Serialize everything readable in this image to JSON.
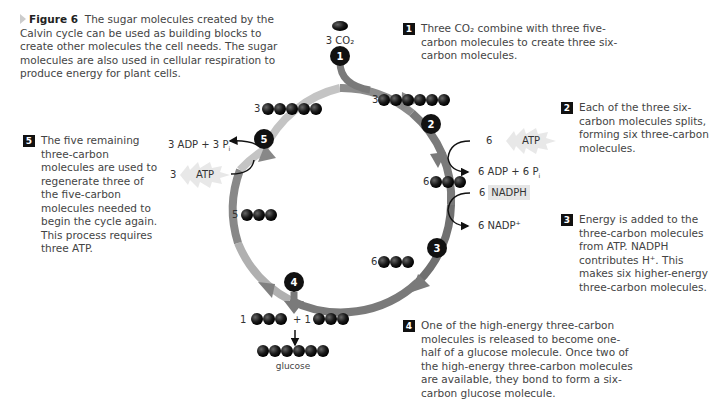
{
  "caption": {
    "label": "Figure 6",
    "text": "The sugar molecules created by the Calvin cycle can be used as building blocks to create other molecules the cell needs. The sugar molecules are also used in cellular respiration to produce energy for plant cells."
  },
  "steps": [
    {
      "number": "1",
      "text": "Three CO₂ combine with three five-carbon molecules to create three six-carbon molecules."
    },
    {
      "number": "2",
      "text": "Each of the three six-carbon molecules splits, forming six three-carbon molecules."
    },
    {
      "number": "3",
      "text": "Energy is added to the three-carbon molecules from ATP. NADPH contributes H⁺. This makes six higher-energy three-carbon molecules."
    },
    {
      "number": "4",
      "text": "One of the high-energy three-carbon molecules is released to become one-half of a glucose molecule. Once two of the high-energy three-carbon molecules are available, they bond to form a six-carbon glucose molecule."
    },
    {
      "number": "5",
      "text": "The five remaining three-carbon molecules are used to regenerate three of the five-carbon molecules needed to begin the cycle again. This process requires three ATP."
    }
  ],
  "diagram": {
    "co2_label": "3 CO₂",
    "markers": [
      "1",
      "2",
      "3",
      "4",
      "5"
    ],
    "molecule_counts": {
      "six_carbon": "3",
      "three_carbon_after_split": "6",
      "three_carbon_high_energy": "6",
      "three_carbon_remaining": "5",
      "five_carbon": "3",
      "released_a": "1",
      "released_b": "+ 1"
    },
    "step2_inputs": {
      "atp_count": "6",
      "atp": "ATP",
      "products": "6 ADP + 6 P",
      "products_sub": "i"
    },
    "step3_inputs": {
      "nadph_count": "6",
      "nadph": "NADPH",
      "products": "6 NADP⁺"
    },
    "step5_inputs": {
      "atp_count": "3",
      "atp": "ATP",
      "products": "3 ADP + 3 P",
      "products_sub": "i"
    },
    "glucose_label": "glucose"
  },
  "colors": {
    "cycle_dark": "#6e6e6e",
    "cycle_light": "#bdbdbd",
    "marker": "#111111",
    "molecule": "#1a1a1a",
    "text": "#444444"
  }
}
